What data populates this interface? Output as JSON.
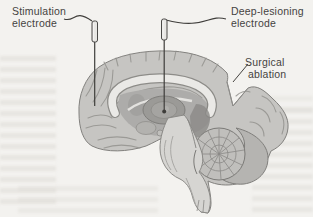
{
  "figure": {
    "labels": {
      "stimulation": {
        "line1": "Stimulation",
        "line2": "electrode"
      },
      "deep_lesioning": {
        "line1": "Deep-lesioning",
        "line2": "electrode"
      },
      "surgical_ablation": {
        "line1": "Surgical",
        "line2": "ablation"
      }
    },
    "colors": {
      "background": "#f3f2ef",
      "text": "#45433f",
      "brain_fill": "#c6c5c2",
      "brain_outline": "#82817e",
      "gyri_line": "#94938f",
      "corpus_callosum": "#eae9e6",
      "subcortical": "#adacaa",
      "thalamus": "#9b9a97",
      "brainstem": "#d6d5d2",
      "cerebellum": "#c0bfbc",
      "electrode": "#3e3d3a",
      "bleed": "#dcdad5"
    }
  }
}
